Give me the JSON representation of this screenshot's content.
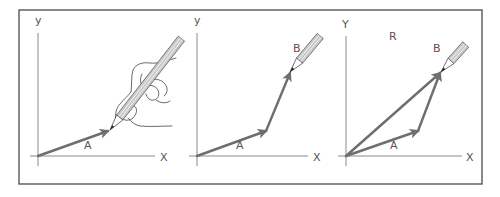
{
  "figure": {
    "colors": {
      "frame": "#4a4a4a",
      "axis": "#8a8a8a",
      "vector": "#6e6e6e",
      "label": "#555555"
    },
    "panels": [
      {
        "id": "panel-1",
        "axis_labels": {
          "x": "X",
          "y": "y"
        },
        "vectors": [
          {
            "name": "A",
            "label": "A",
            "from": [
              0,
              0
            ],
            "to": [
              70,
              25
            ]
          }
        ],
        "drawing_tool": "hand holding pencil",
        "pencil_at": [
          72,
          26
        ]
      },
      {
        "id": "panel-2",
        "axis_labels": {
          "x": "X",
          "y": "y"
        },
        "vectors": [
          {
            "name": "A",
            "label": "A",
            "from": [
              0,
              0
            ],
            "to": [
              69,
              25
            ]
          },
          {
            "name": "B",
            "label": "B",
            "from": [
              69,
              25
            ],
            "to": [
              93,
              83
            ]
          }
        ],
        "drawing_tool": "pencil",
        "pencil_at": [
          94,
          84
        ]
      },
      {
        "id": "panel-3",
        "axis_labels": {
          "x": "X",
          "y": "Y"
        },
        "vectors": [
          {
            "name": "A",
            "label": "A",
            "from": [
              0,
              0
            ],
            "to": [
              72,
              25
            ]
          },
          {
            "name": "B",
            "label": "B",
            "from": [
              72,
              25
            ],
            "to": [
              94,
              83
            ]
          },
          {
            "name": "R",
            "label": "R",
            "from": [
              0,
              0
            ],
            "to": [
              94,
              83
            ]
          }
        ],
        "drawing_tool": "pencil",
        "pencil_at": [
          95,
          84
        ]
      }
    ]
  }
}
